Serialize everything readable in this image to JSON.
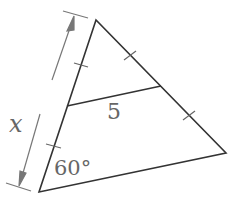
{
  "figure": {
    "type": "triangle-midsegment",
    "vertices": {
      "top": {
        "x": 96,
        "y": 20
      },
      "bottom_left": {
        "x": 39,
        "y": 192
      },
      "right": {
        "x": 226,
        "y": 153
      }
    },
    "midsegment": {
      "from": {
        "x": 67,
        "y": 106
      },
      "to": {
        "x": 161,
        "y": 86
      }
    },
    "colors": {
      "triangle_stroke": "#333333",
      "annotation": "#777777"
    }
  },
  "labels": {
    "side_length": "x",
    "midsegment_length": "5",
    "angle": "60°"
  }
}
